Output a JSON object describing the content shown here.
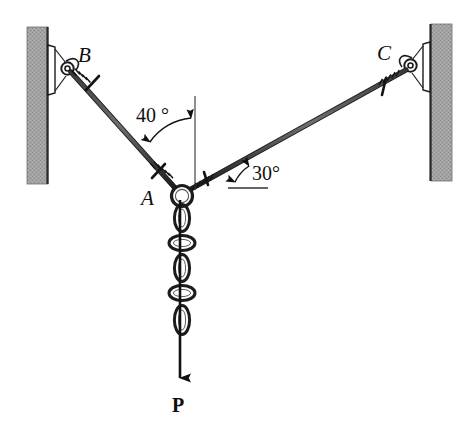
{
  "figure": {
    "background_color": "#ffffff",
    "line_color": "#1a1a1a",
    "wall_fill": "#9d9d9d",
    "wall_edge_color": "#3a3a3a"
  },
  "labels": {
    "point_a": "A",
    "point_b": "B",
    "point_c": "C",
    "angle_ab": "40 °",
    "angle_ac": "30°",
    "load": "P"
  },
  "geometry": {
    "point_a": {
      "x": 179,
      "y": 192
    },
    "point_b": {
      "x": 67,
      "y": 65
    },
    "point_c": {
      "x": 408,
      "y": 62
    },
    "angle_ab_from_vertical_deg": 40,
    "angle_ac_from_horizontal_deg": 30,
    "chain_links": 5,
    "load_arrow_tip": {
      "x": 179,
      "y": 382
    }
  },
  "walls": {
    "left": {
      "x": 27,
      "y": 27,
      "width": 21,
      "height": 157
    },
    "right": {
      "x": 431,
      "y": 24,
      "width": 21,
      "height": 157
    }
  }
}
